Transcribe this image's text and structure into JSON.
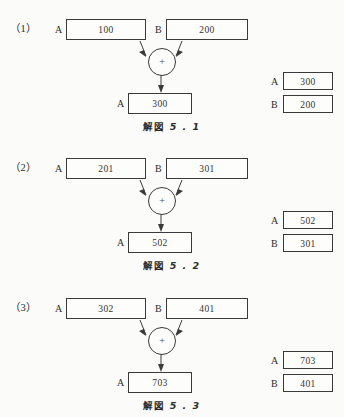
{
  "document": {
    "figure_style": "dataflow-addition-diagram",
    "ink_color": "#3a3a3a",
    "paper_color": "#fbfbf9"
  },
  "labels": {
    "operand_a": "A",
    "operand_b": "B",
    "result_a": "A",
    "memory_a": "A",
    "memory_b": "B",
    "operator": "+"
  },
  "blocks": [
    {
      "number": "（1）",
      "operand_a_value": "100",
      "operand_b_value": "200",
      "result_value": "300",
      "memory_a_value": "300",
      "memory_b_value": "200",
      "caption_prefix": "解図",
      "caption_figure": "5 . 1"
    },
    {
      "number": "（2）",
      "operand_a_value": "201",
      "operand_b_value": "301",
      "result_value": "502",
      "memory_a_value": "502",
      "memory_b_value": "301",
      "caption_prefix": "解図",
      "caption_figure": "5 . 2"
    },
    {
      "number": "（3）",
      "operand_a_value": "302",
      "operand_b_value": "401",
      "result_value": "703",
      "memory_a_value": "703",
      "memory_b_value": "401",
      "caption_prefix": "解図",
      "caption_figure": "5 . 3"
    }
  ]
}
